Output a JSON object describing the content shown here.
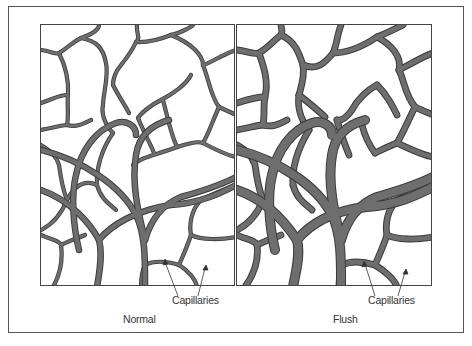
{
  "figure": {
    "panels": [
      {
        "id": "normal",
        "title": "Normal",
        "annotation": "Capillaries"
      },
      {
        "id": "flush",
        "title": "Flush",
        "annotation": "Capillaries"
      }
    ]
  },
  "colors": {
    "vessel_fill": "#6e6e6e",
    "vessel_outline": "#3a3a3a",
    "border": "#444444",
    "background": "#ffffff"
  }
}
